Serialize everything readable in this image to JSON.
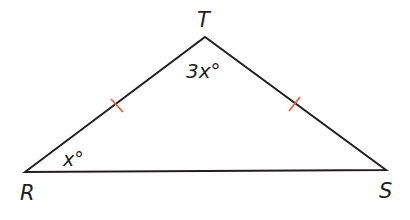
{
  "diagram": {
    "type": "isosceles-triangle",
    "vertices": {
      "R": {
        "label": "R",
        "x": 25,
        "y": 172
      },
      "S": {
        "label": "S",
        "x": 386,
        "y": 170
      },
      "T": {
        "label": "T",
        "x": 205,
        "y": 37
      }
    },
    "angles": {
      "T": {
        "label": "3x°"
      },
      "R": {
        "label": "x°"
      }
    },
    "congruence_marks": {
      "count": 2,
      "sides": [
        "RT",
        "TS"
      ],
      "color": "#e8623a"
    },
    "line_color": "#231f20"
  }
}
